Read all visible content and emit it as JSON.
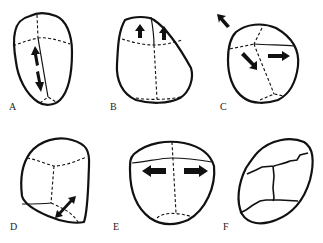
{
  "figure": {
    "panels": [
      {
        "id": "A",
        "label": "A",
        "arrows": "vertical up/down along sagittal line"
      },
      {
        "id": "B",
        "label": "B",
        "arrows": "two upward arrows in top section"
      },
      {
        "id": "C",
        "label": "C",
        "arrows": "outward diagonal, inward diagonal, rightward"
      },
      {
        "id": "D",
        "label": "D",
        "arrows": "double-headed diagonal at lower right"
      },
      {
        "id": "E",
        "label": "E",
        "arrows": "left and right horizontal"
      },
      {
        "id": "F",
        "label": "F",
        "arrows": "none; solid fracture lines"
      }
    ],
    "colors": {
      "line": "#111111",
      "background": "#ffffff"
    }
  }
}
